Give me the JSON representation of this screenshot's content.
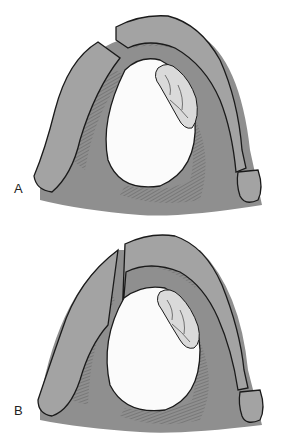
{
  "figure": {
    "panels": [
      {
        "label": "A",
        "description": "Cross-section with cyst, nodule, and bone flap cut through with separated segments"
      },
      {
        "label": "B",
        "description": "Cross-section with cyst, nodule, and oblique cut through bone"
      }
    ]
  },
  "colors": {
    "bone": "#a3a3a3",
    "soft_tissue": "#8f8f8f",
    "cyst": "#fbfbfb",
    "nodule": "#dadada",
    "outline": "#1a1a1a",
    "hatch": "#555555"
  }
}
